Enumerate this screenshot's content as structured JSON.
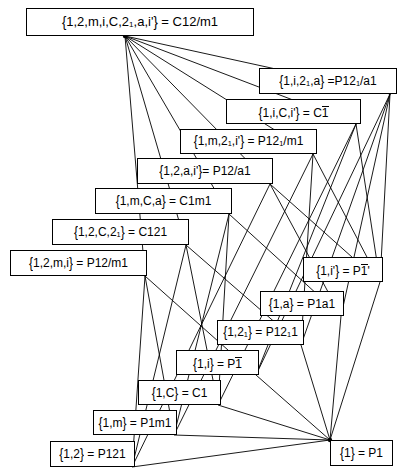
{
  "diagram": {
    "type": "hasse-lattice",
    "width": 398,
    "height": 475,
    "line_color": "#000000",
    "box_border_color": "#000000",
    "background_color": "#ffffff",
    "nodes": [
      {
        "id": "n0",
        "set": "{1,2,m,i,C,2_1,a,i'}",
        "symbol": "C12/m1",
        "label_html": "<span class=\"brc\">{</span>1,2,m,i,C,2<sub>1</sub>,a,i'<span class=\"brc\">}</span> = C12/m1",
        "x": 26,
        "y": 8,
        "w": 228,
        "h": 28,
        "font_size": 13,
        "link": {
          "x": 125,
          "y": 36
        }
      },
      {
        "id": "n1",
        "set": "{1,i,2_1,a}",
        "symbol": "P12_1/a1",
        "label_html": "<span class=\"brc\">{</span>1,i,2<sub>1</sub>,a<span class=\"brc\">}</span> =P12<sub>1</sub>/a1",
        "x": 259,
        "y": 68,
        "w": 138,
        "h": 26,
        "font_size": 12,
        "link": {
          "x": 390,
          "y": 94
        }
      },
      {
        "id": "n2",
        "set": "{1,i,C,i'}",
        "symbol": "C1bar",
        "label_html": "<span class=\"brc\">{</span>1,i,C,i'<span class=\"brc\">}</span> = C<span class=\"ovl\">1</span>",
        "x": 226,
        "y": 99,
        "w": 135,
        "h": 25,
        "font_size": 12,
        "link": {
          "x": 356,
          "y": 124
        }
      },
      {
        "id": "n3",
        "set": "{1,m,2_1,i'}",
        "symbol": "P12_1/m1",
        "label_html": "<span class=\"brc\">{</span>1,m,2<sub>1</sub>,i'<span class=\"brc\">}</span> = P12<sub>1</sub>/m1",
        "x": 180,
        "y": 129,
        "w": 137,
        "h": 25,
        "font_size": 12,
        "link": {
          "x": 313,
          "y": 154
        }
      },
      {
        "id": "n4",
        "set": "{1,2,a,i'}",
        "symbol": "P12/a1",
        "label_html": "<span class=\"brc\">{</span>1,2,a,i'<span class=\"brc\">}</span>= P12/a1",
        "x": 137,
        "y": 158,
        "w": 136,
        "h": 26,
        "font_size": 12,
        "link": {
          "x": 270,
          "y": 184
        }
      },
      {
        "id": "n5",
        "set": "{1,m,C,a}",
        "symbol": "C1m1",
        "label_html": "<span class=\"brc\">{</span>1,m,C,a<span class=\"brc\">}</span>  =  C1m1",
        "x": 95,
        "y": 188,
        "w": 137,
        "h": 26,
        "font_size": 12,
        "link": {
          "x": 229,
          "y": 214
        }
      },
      {
        "id": "n6",
        "set": "{1,2,C,2_1}",
        "symbol": "C121",
        "label_html": "<span class=\"brc\">{</span>1,2,C,2<sub>1</sub><span class=\"brc\">}</span>  =  C121",
        "x": 52,
        "y": 219,
        "w": 137,
        "h": 26,
        "font_size": 12,
        "link": {
          "x": 186,
          "y": 245
        }
      },
      {
        "id": "n7",
        "set": "{1,2,m,i}",
        "symbol": "P12/m1",
        "label_html": "<span class=\"brc\">{</span>1,2,m,i<span class=\"brc\">}</span>  =  P12/m1",
        "x": 10,
        "y": 250,
        "w": 137,
        "h": 26,
        "font_size": 12,
        "link": {
          "x": 145,
          "y": 276
        }
      },
      {
        "id": "n8",
        "set": "{1,i'}",
        "symbol": "P1bar'",
        "label_html": "<span class=\"brc\">{</span>1,i'<span class=\"brc\">}</span> = P<span class=\"ovl\">1</span>'",
        "x": 303,
        "y": 257,
        "w": 80,
        "h": 25,
        "font_size": 12,
        "link": {
          "x": 380,
          "y": 282
        }
      },
      {
        "id": "n9",
        "set": "{1,a}",
        "symbol": "P1a1",
        "label_html": "<span class=\"brc\">{</span>1,a<span class=\"brc\">}</span> = P1a1",
        "x": 260,
        "y": 291,
        "w": 84,
        "h": 25,
        "font_size": 12,
        "link": {
          "x": 341,
          "y": 316
        }
      },
      {
        "id": "n10",
        "set": "{1,2_1}",
        "symbol": "P12_11",
        "label_html": "<span class=\"brc\">{</span>1,2<sub>1</sub><span class=\"brc\">}</span> = P12<sub>1</sub>1",
        "x": 217,
        "y": 320,
        "w": 87,
        "h": 25,
        "font_size": 12,
        "link": {
          "x": 301,
          "y": 345
        }
      },
      {
        "id": "n11",
        "set": "{1,i}",
        "symbol": "P1bar",
        "label_html": "<span class=\"brc\">{</span>1,i<span class=\"brc\">}</span> = P<span class=\"ovl\">1</span>",
        "x": 176,
        "y": 350,
        "w": 83,
        "h": 25,
        "font_size": 12,
        "link": {
          "x": 256,
          "y": 375
        }
      },
      {
        "id": "n12",
        "set": "{1,C}",
        "symbol": "C1",
        "label_html": "<span class=\"brc\">{</span>1,C<span class=\"brc\">}</span>  =   C1",
        "x": 138,
        "y": 380,
        "w": 83,
        "h": 25,
        "font_size": 12,
        "link": {
          "x": 218,
          "y": 405
        }
      },
      {
        "id": "n13",
        "set": "{1,m}",
        "symbol": "P1m1",
        "label_html": "<span class=\"brc\">{</span>1,m<span class=\"brc\">}</span> = P1m1",
        "x": 93,
        "y": 410,
        "w": 84,
        "h": 25,
        "font_size": 12,
        "link": {
          "x": 174,
          "y": 435
        }
      },
      {
        "id": "n14",
        "set": "{1,2}",
        "symbol": "P121",
        "label_html": "<span class=\"brc\">{</span>1,2<span class=\"brc\">}</span> = P121",
        "x": 50,
        "y": 441,
        "w": 85,
        "h": 26,
        "font_size": 12,
        "link": {
          "x": 132,
          "y": 467
        }
      },
      {
        "id": "n15",
        "set": "{1}",
        "symbol": "P1",
        "label_html": "<span class=\"brc\">{</span>1<span class=\"brc\">}</span> = P1",
        "x": 330,
        "y": 440,
        "w": 63,
        "h": 26,
        "font_size": 12,
        "link": {
          "x": 330,
          "y": 440
        }
      }
    ],
    "edges": [
      {
        "from": "n0",
        "to": "n1"
      },
      {
        "from": "n0",
        "to": "n2"
      },
      {
        "from": "n0",
        "to": "n3"
      },
      {
        "from": "n0",
        "to": "n4"
      },
      {
        "from": "n0",
        "to": "n5"
      },
      {
        "from": "n0",
        "to": "n6"
      },
      {
        "from": "n0",
        "to": "n7"
      },
      {
        "from": "n1",
        "to": "n8"
      },
      {
        "from": "n1",
        "to": "n9"
      },
      {
        "from": "n1",
        "to": "n10"
      },
      {
        "from": "n1",
        "to": "n11"
      },
      {
        "from": "n2",
        "to": "n8"
      },
      {
        "from": "n2",
        "to": "n11"
      },
      {
        "from": "n2",
        "to": "n12"
      },
      {
        "from": "n3",
        "to": "n8"
      },
      {
        "from": "n3",
        "to": "n10"
      },
      {
        "from": "n3",
        "to": "n13"
      },
      {
        "from": "n4",
        "to": "n8"
      },
      {
        "from": "n4",
        "to": "n9"
      },
      {
        "from": "n4",
        "to": "n14"
      },
      {
        "from": "n5",
        "to": "n9"
      },
      {
        "from": "n5",
        "to": "n12"
      },
      {
        "from": "n5",
        "to": "n13"
      },
      {
        "from": "n6",
        "to": "n10"
      },
      {
        "from": "n6",
        "to": "n12"
      },
      {
        "from": "n6",
        "to": "n14"
      },
      {
        "from": "n7",
        "to": "n11"
      },
      {
        "from": "n7",
        "to": "n13"
      },
      {
        "from": "n7",
        "to": "n14"
      },
      {
        "from": "n8",
        "to": "n15"
      },
      {
        "from": "n9",
        "to": "n15"
      },
      {
        "from": "n10",
        "to": "n15"
      },
      {
        "from": "n11",
        "to": "n15"
      },
      {
        "from": "n12",
        "to": "n15"
      },
      {
        "from": "n13",
        "to": "n15"
      },
      {
        "from": "n14",
        "to": "n15"
      }
    ]
  }
}
